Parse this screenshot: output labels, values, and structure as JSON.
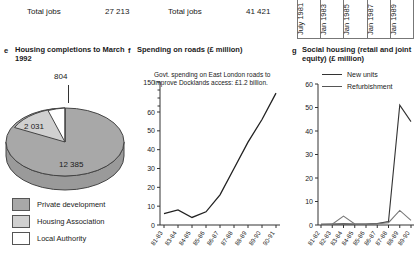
{
  "top_strip": {
    "jobs_a_label": "Total jobs",
    "jobs_a_value": "27 213",
    "jobs_b_label": "Total jobs",
    "jobs_b_value": "41 421",
    "date_columns": [
      "July 1981",
      "Jan 1983",
      "Jan 1985",
      "Jan 1987",
      "Jan 1989"
    ]
  },
  "panel_e": {
    "letter": "e",
    "title": "Housing completions to March 1992",
    "legend": [
      {
        "label": "Private development",
        "color": "#a8a8a8"
      },
      {
        "label": "Housing Association",
        "color": "#d0d0d0"
      },
      {
        "label": "Local Authority",
        "color": "#ffffff"
      }
    ],
    "labels": {
      "top": "804",
      "left": "2 031",
      "bottom": "12 385"
    }
  },
  "panel_f": {
    "letter": "f",
    "title": "Spending on roads (£ million)",
    "note": "Govt. spending on East London roads to improve Docklands access: £1.2 billion."
  },
  "panel_g": {
    "letter": "g",
    "title": "Social housing (retail and joint equity) (£ million)",
    "legend": [
      {
        "label": "New units",
        "color": "#333333"
      },
      {
        "label": "Refurbishment",
        "color": "#777777"
      }
    ]
  },
  "chart_data": [
    {
      "id": "panel_e_pie",
      "type": "pie",
      "title": "Housing completions to March 1992",
      "unit": "dwellings",
      "labels": [
        "Private development",
        "Housing Association",
        "Local Authority"
      ],
      "values": [
        12385,
        2031,
        804
      ],
      "colors": [
        "#a8a8a8",
        "#d0d0d0",
        "#ffffff"
      ],
      "legend": "bottom-left",
      "display_labels": [
        "12 385",
        "2 031",
        "804"
      ]
    },
    {
      "id": "panel_f_roads",
      "type": "line",
      "title": "Spending on roads (£ million)",
      "xlabel": "",
      "ylabel": "£ million",
      "ylim": [
        0,
        60
      ],
      "axis_break_top_value": 150,
      "yticks": [
        0,
        10,
        20,
        30,
        40,
        50,
        60,
        150
      ],
      "grid": false,
      "categories": [
        "81-83",
        "83-84",
        "84-85",
        "85-86",
        "86-87",
        "87-88",
        "88-89",
        "89-90",
        "90-91"
      ],
      "values": [
        6,
        8,
        4,
        7,
        16,
        30,
        44,
        56,
        70
      ],
      "annotation": "Govt. spending on East London roads to improve Docklands access: £1.2 billion."
    },
    {
      "id": "panel_g_social_housing",
      "type": "line",
      "title": "Social housing (retail and joint equity) (£ million)",
      "xlabel": "",
      "ylabel": "£ million",
      "ylim": [
        0,
        60
      ],
      "yticks": [
        0,
        10,
        20,
        30,
        40,
        50,
        60
      ],
      "grid": false,
      "categories": [
        "81-82",
        "82-83",
        "83-84",
        "84-85",
        "85-86",
        "86-87",
        "87-88",
        "88-89",
        "89-90"
      ],
      "series": [
        {
          "name": "New units",
          "values": [
            0.3,
            0.4,
            0.5,
            0.4,
            0.4,
            0.6,
            1.5,
            51,
            44
          ]
        },
        {
          "name": "Refurbishment",
          "values": [
            0.3,
            0.3,
            3.8,
            0.4,
            0.3,
            0.5,
            1.0,
            6.2,
            2.0
          ]
        }
      ]
    }
  ]
}
